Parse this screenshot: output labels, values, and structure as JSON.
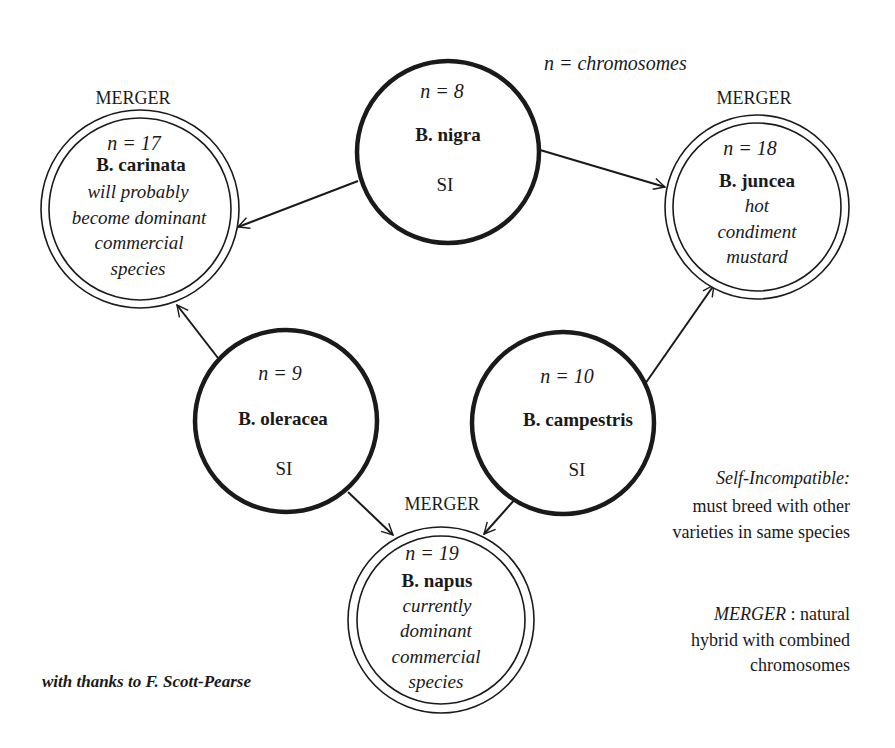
{
  "diagram": {
    "title_note": "n = chromosomes",
    "colors": {
      "stroke": "#1a1a1a",
      "background": "#ffffff"
    },
    "nodes": [
      {
        "id": "nigra",
        "type": "parent",
        "n_label": "n = 8",
        "name": "B. nigra",
        "tag": "SI",
        "cx": 448,
        "cy": 152,
        "r": 92
      },
      {
        "id": "oleracea",
        "type": "parent",
        "n_label": "n = 9",
        "name": "B. oleracea",
        "tag": "SI",
        "cx": 286,
        "cy": 421,
        "r": 92
      },
      {
        "id": "campestris",
        "type": "parent",
        "n_label": "n = 10",
        "name": "B. campestris",
        "tag": "SI",
        "cx": 563,
        "cy": 423,
        "r": 92
      },
      {
        "id": "carinata",
        "type": "merger",
        "merger_label": "MERGER",
        "n_label": "n = 17",
        "name": "B. carinata",
        "desc": [
          "will probably",
          "become dominant",
          "commercial",
          "species"
        ],
        "cx": 140,
        "cy": 209,
        "r": 99
      },
      {
        "id": "juncea",
        "type": "merger",
        "merger_label": "MERGER",
        "n_label": "n = 18",
        "name": "B. juncea",
        "desc": [
          "hot",
          "condiment",
          "mustard"
        ],
        "cx": 757,
        "cy": 207,
        "r": 92
      },
      {
        "id": "napus",
        "type": "merger",
        "merger_label": "MERGER",
        "n_label": "n = 19",
        "name": "B. napus",
        "desc": [
          "currently",
          "dominant",
          "commercial",
          "species"
        ],
        "cx": 441,
        "cy": 620,
        "r": 93
      }
    ],
    "edges": [
      {
        "from": "nigra",
        "to": "carinata"
      },
      {
        "from": "nigra",
        "to": "juncea"
      },
      {
        "from": "oleracea",
        "to": "carinata"
      },
      {
        "from": "oleracea",
        "to": "napus"
      },
      {
        "from": "campestris",
        "to": "juncea"
      },
      {
        "from": "campestris",
        "to": "napus"
      }
    ]
  },
  "legend": {
    "si_term": "Self-Incompatible:",
    "si_lines": [
      "must breed with other",
      "varieties in same species"
    ],
    "merger_term": "MERGER",
    "merger_first": " : natural",
    "merger_lines": [
      "hybrid with combined",
      "chromosomes"
    ]
  },
  "credit": "with thanks to F. Scott-Pearse"
}
